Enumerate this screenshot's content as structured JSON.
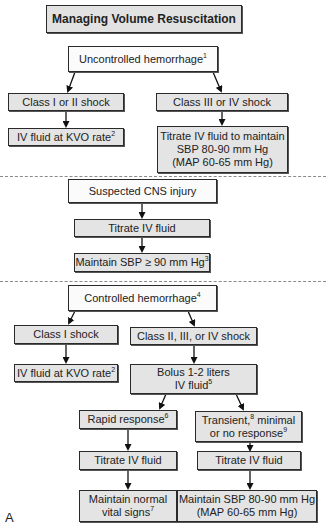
{
  "title": "Managing Volume Resuscitation",
  "figure_label": "A",
  "section1": {
    "root": {
      "text": "Uncontrolled hemorrhage",
      "sup": "1"
    },
    "left": {
      "class": {
        "text": "Class I or II shock"
      },
      "action": {
        "text": "IV fluid at KVO rate",
        "sup": "2"
      }
    },
    "right": {
      "class": {
        "text": "Class III or IV shock"
      },
      "action": {
        "line1": "Titrate IV fluid to maintain",
        "line2": "SBP 80-90 mm Hg",
        "line3": "(MAP 60-65 mm Hg)"
      }
    }
  },
  "section2": {
    "root": {
      "text": "Suspected CNS injury"
    },
    "step1": {
      "text": "Titrate IV fluid"
    },
    "step2": {
      "text": "Maintain SBP ≥ 90 mm Hg",
      "sup": "3"
    }
  },
  "section3": {
    "root": {
      "text": "Controlled hemorrhage",
      "sup": "4"
    },
    "left": {
      "class": {
        "text": "Class I shock"
      },
      "action": {
        "text": "IV fluid at KVO rate",
        "sup": "2"
      }
    },
    "right": {
      "class": {
        "text": "Class II, III, or IV shock"
      },
      "bolus": {
        "line1": "Bolus 1-2 liters",
        "line2": "IV fluid",
        "sup": "5"
      },
      "rapid": {
        "response": {
          "text": "Rapid response",
          "sup": "6"
        },
        "titrate": {
          "text": "Titrate IV fluid"
        },
        "goal": {
          "line1": "Maintain normal",
          "line2": "vital signs",
          "sup": "7"
        }
      },
      "transient": {
        "response": {
          "line1a": "Transient,",
          "sup1": "8",
          "line1b": " minimal",
          "line2": "or no response",
          "sup2": "9"
        },
        "titrate": {
          "text": "Titrate IV fluid"
        },
        "goal": {
          "line1": "Maintain SBP 80-90 mm Hg",
          "line2": "(MAP 60-65 mm Hg)"
        }
      }
    }
  },
  "colors": {
    "box_fill_gray": "#e4e4e4",
    "box_fill_white": "#fbfbfb",
    "border": "#2a2a2a",
    "dash": "#8a8a8a"
  }
}
